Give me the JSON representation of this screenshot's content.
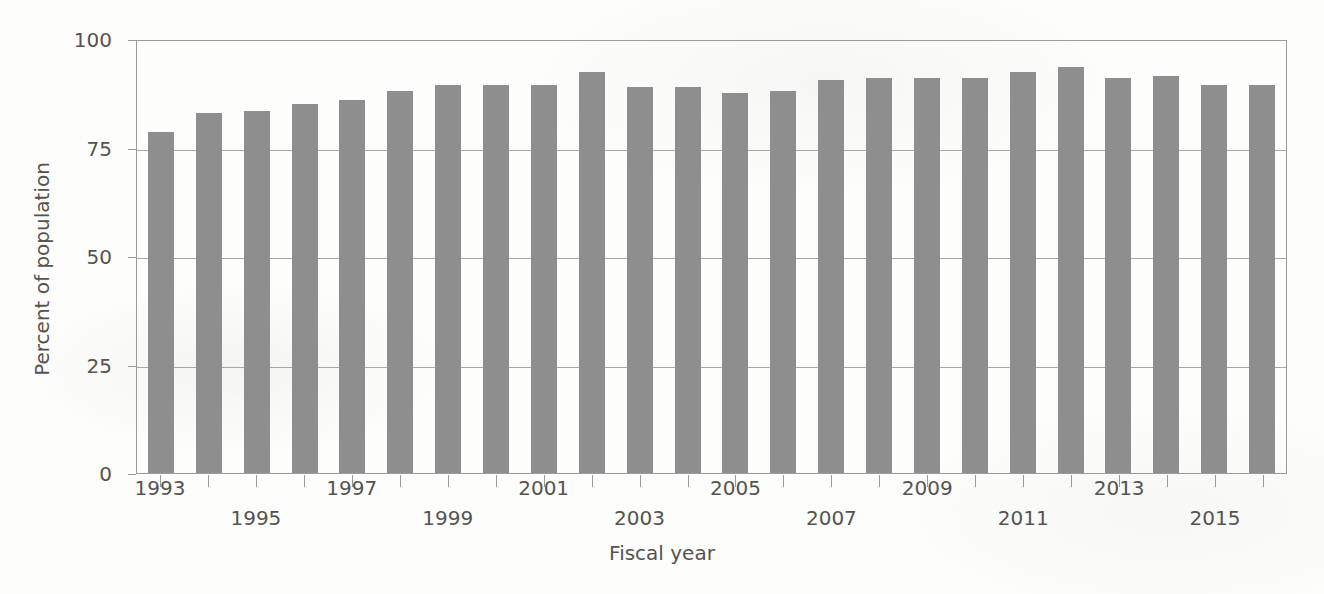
{
  "chart_data": {
    "type": "bar",
    "title": "",
    "xlabel": "Fiscal year",
    "ylabel": "Percent of population",
    "ylim": [
      0,
      100
    ],
    "yticks": [
      0,
      25,
      50,
      75,
      100
    ],
    "grid": true,
    "legend": "none",
    "bar_color": "#8e8e8e",
    "categories": [
      "1993",
      "1994",
      "1995",
      "1996",
      "1997",
      "1998",
      "1999",
      "2000",
      "2001",
      "2002",
      "2003",
      "2004",
      "2005",
      "2006",
      "2007",
      "2008",
      "2009",
      "2010",
      "2011",
      "2012",
      "2013",
      "2014",
      "2015",
      "2016"
    ],
    "values": [
      78.5,
      83.0,
      83.5,
      85.0,
      86.0,
      88.0,
      89.5,
      89.5,
      89.5,
      92.5,
      89.0,
      89.0,
      87.5,
      88.0,
      90.5,
      91.0,
      91.0,
      91.0,
      92.5,
      93.5,
      91.0,
      91.5,
      89.5,
      89.5
    ],
    "xtick_labels_top": [
      "1993",
      "1997",
      "2001",
      "2005",
      "2009",
      "2013"
    ],
    "xtick_labels_bottom": [
      "1995",
      "1999",
      "2003",
      "2007",
      "2011",
      "2015"
    ],
    "xtick_label_rows": [
      {
        "label": "1993",
        "index": 0,
        "row": "top"
      },
      {
        "label": "1995",
        "index": 2,
        "row": "bottom"
      },
      {
        "label": "1997",
        "index": 4,
        "row": "top"
      },
      {
        "label": "1999",
        "index": 6,
        "row": "bottom"
      },
      {
        "label": "2001",
        "index": 8,
        "row": "top"
      },
      {
        "label": "2003",
        "index": 10,
        "row": "bottom"
      },
      {
        "label": "2005",
        "index": 12,
        "row": "top"
      },
      {
        "label": "2007",
        "index": 14,
        "row": "bottom"
      },
      {
        "label": "2009",
        "index": 16,
        "row": "top"
      },
      {
        "label": "2011",
        "index": 18,
        "row": "bottom"
      },
      {
        "label": "2013",
        "index": 20,
        "row": "top"
      },
      {
        "label": "2015",
        "index": 22,
        "row": "bottom"
      }
    ]
  }
}
